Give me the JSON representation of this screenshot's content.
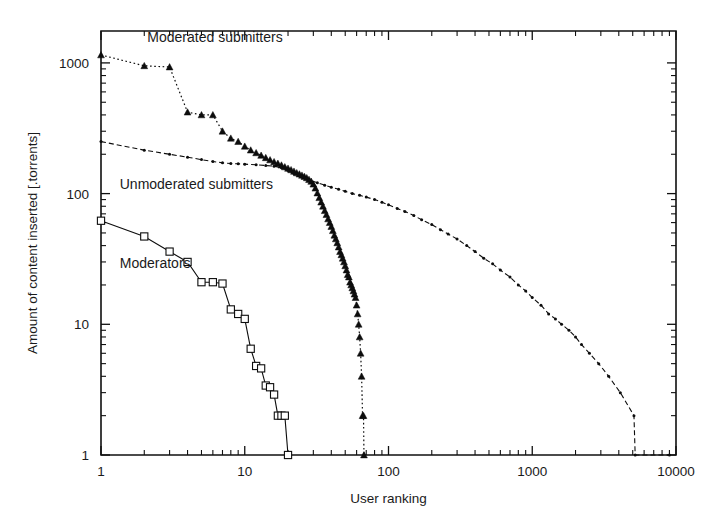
{
  "chart_data": {
    "type": "line",
    "title": "",
    "xlabel": "User ranking",
    "ylabel": "Amount of content inserted [.torrents]",
    "xscale": "log",
    "yscale": "log",
    "xlim": [
      1,
      10000
    ],
    "ylim": [
      1,
      2000
    ],
    "xticks": [
      1,
      10,
      100,
      1000,
      10000
    ],
    "xticklabels": [
      "1",
      "10",
      "100",
      "1000",
      "10000"
    ],
    "yticks": [
      1,
      10,
      100,
      1000
    ],
    "yticklabels": [
      "1",
      "10",
      "100",
      "1000"
    ],
    "grid": false,
    "legend_position": "inline-annotations",
    "series": [
      {
        "name": "Moderated submitters",
        "marker": "triangle",
        "line": "dotted",
        "label_x": 2.1,
        "label_y": 1450,
        "points": [
          [
            1,
            1150
          ],
          [
            2,
            950
          ],
          [
            3,
            930
          ],
          [
            4,
            420
          ],
          [
            5,
            400
          ],
          [
            6,
            400
          ],
          [
            7,
            300
          ],
          [
            8,
            265
          ],
          [
            9,
            250
          ],
          [
            10,
            230
          ],
          [
            11,
            215
          ],
          [
            12,
            205
          ],
          [
            13,
            196
          ],
          [
            14,
            188
          ],
          [
            15,
            181
          ],
          [
            16,
            175
          ],
          [
            17,
            170
          ],
          [
            18,
            165
          ],
          [
            19,
            160
          ],
          [
            20,
            156
          ],
          [
            21,
            152
          ],
          [
            22,
            148
          ],
          [
            23,
            144
          ],
          [
            24,
            141
          ],
          [
            25,
            138
          ],
          [
            26,
            135
          ],
          [
            27,
            132
          ],
          [
            28,
            128
          ],
          [
            29,
            124
          ],
          [
            30,
            118
          ],
          [
            31,
            110
          ],
          [
            32,
            101
          ],
          [
            33,
            93
          ],
          [
            34,
            86
          ],
          [
            35,
            80
          ],
          [
            36,
            74
          ],
          [
            37,
            69
          ],
          [
            38,
            64
          ],
          [
            39,
            60
          ],
          [
            40,
            56
          ],
          [
            41,
            52
          ],
          [
            42,
            48
          ],
          [
            43,
            45
          ],
          [
            44,
            42
          ],
          [
            45,
            39
          ],
          [
            46,
            36
          ],
          [
            47,
            34
          ],
          [
            48,
            32
          ],
          [
            49,
            30
          ],
          [
            50,
            28
          ],
          [
            51,
            26
          ],
          [
            52,
            24
          ],
          [
            53,
            23
          ],
          [
            54,
            21
          ],
          [
            55,
            20
          ],
          [
            56,
            19
          ],
          [
            57,
            18
          ],
          [
            58,
            17
          ],
          [
            59,
            16
          ],
          [
            60,
            14
          ],
          [
            61,
            12
          ],
          [
            62,
            10
          ],
          [
            63,
            8
          ],
          [
            64,
            6
          ],
          [
            65,
            4
          ],
          [
            66,
            2
          ],
          [
            67,
            2
          ],
          [
            67.5,
            1
          ]
        ]
      },
      {
        "name": "Unmoderated submitters",
        "marker": "dot",
        "line": "dashed",
        "label_x": 1.35,
        "label_y": 108,
        "points": [
          [
            1,
            250
          ],
          [
            2,
            215
          ],
          [
            3,
            200
          ],
          [
            4,
            190
          ],
          [
            5,
            182
          ],
          [
            6,
            176
          ],
          [
            7,
            172
          ],
          [
            8,
            170
          ],
          [
            9,
            169
          ],
          [
            10,
            168
          ],
          [
            12,
            166
          ],
          [
            14,
            164
          ],
          [
            16,
            162
          ],
          [
            18,
            158
          ],
          [
            20,
            150
          ],
          [
            22,
            142
          ],
          [
            25,
            134
          ],
          [
            28,
            127
          ],
          [
            32,
            121
          ],
          [
            36,
            116
          ],
          [
            40,
            112
          ],
          [
            45,
            108
          ],
          [
            50,
            104
          ],
          [
            56,
            100
          ],
          [
            63,
            97
          ],
          [
            70,
            94
          ],
          [
            80,
            90
          ],
          [
            90,
            86
          ],
          [
            100,
            82
          ],
          [
            115,
            77
          ],
          [
            130,
            73
          ],
          [
            150,
            68
          ],
          [
            170,
            63
          ],
          [
            200,
            58
          ],
          [
            230,
            53
          ],
          [
            260,
            49
          ],
          [
            300,
            45
          ],
          [
            350,
            40
          ],
          [
            400,
            36
          ],
          [
            460,
            32
          ],
          [
            530,
            29
          ],
          [
            600,
            26
          ],
          [
            700,
            23
          ],
          [
            800,
            20
          ],
          [
            900,
            18
          ],
          [
            1000,
            16
          ],
          [
            1150,
            14
          ],
          [
            1300,
            12
          ],
          [
            1450,
            11
          ],
          [
            1600,
            10
          ],
          [
            1800,
            9
          ],
          [
            2000,
            8
          ],
          [
            2200,
            7
          ],
          [
            2500,
            6
          ],
          [
            2900,
            5
          ],
          [
            3400,
            4
          ],
          [
            4100,
            3
          ],
          [
            5100,
            2
          ],
          [
            5200,
            1
          ],
          [
            9000,
            1
          ]
        ]
      },
      {
        "name": "Moderators",
        "marker": "square",
        "line": "solid",
        "label_x": 1.35,
        "label_y": 27,
        "points": [
          [
            1,
            62
          ],
          [
            2,
            47
          ],
          [
            3,
            36
          ],
          [
            4,
            30
          ],
          [
            5,
            21
          ],
          [
            6,
            21
          ],
          [
            7,
            20.5
          ],
          [
            8,
            13
          ],
          [
            9,
            12
          ],
          [
            10,
            11
          ],
          [
            11,
            6.5
          ],
          [
            12,
            4.8
          ],
          [
            13,
            4.6
          ],
          [
            14,
            3.4
          ],
          [
            15,
            3.3
          ],
          [
            16,
            2.9
          ],
          [
            17,
            2.0
          ],
          [
            18,
            2.0
          ],
          [
            19,
            2.0
          ],
          [
            20,
            1.0
          ]
        ]
      }
    ]
  }
}
